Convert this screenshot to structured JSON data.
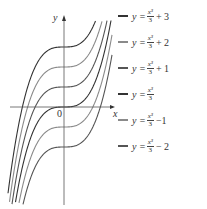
{
  "chart_data": {
    "type": "line",
    "title": "",
    "xlabel": "x",
    "ylabel": "y",
    "origin_label": "0",
    "grid": false,
    "legend_position": "right",
    "series": [
      {
        "name": "y = x^3/3 + 3",
        "shift": 3,
        "color": "#333333",
        "label_num": "x³",
        "label_den": "3",
        "label_tail": "+ 3"
      },
      {
        "name": "y = x^3/3 + 2",
        "shift": 2,
        "color": "#8a8a8a",
        "label_num": "x³",
        "label_den": "3",
        "label_tail": "+ 2"
      },
      {
        "name": "y = x^3/3 + 1",
        "shift": 1,
        "color": "#555555",
        "label_num": "x³",
        "label_den": "3",
        "label_tail": "+ 1"
      },
      {
        "name": "y = x^3/3",
        "shift": 0,
        "color": "#333333",
        "label_num": "x³",
        "label_den": "3",
        "label_tail": ""
      },
      {
        "name": "y = x^3/3 - 1",
        "shift": -1,
        "color": "#8a8a8a",
        "label_num": "x³",
        "label_den": "3",
        "label_tail": "−1"
      },
      {
        "name": "y = x^3/3 - 2",
        "shift": -2,
        "color": "#555555",
        "label_num": "x³",
        "label_den": "3",
        "label_tail": "− 2"
      }
    ],
    "x_function": "x^3/3 + c",
    "xlim": [
      -2.3,
      2.3
    ],
    "ylim": [
      -4.9,
      4.4
    ]
  },
  "legend": {
    "prefix": "y ="
  }
}
